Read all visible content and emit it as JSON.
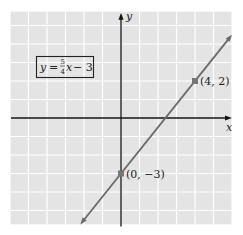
{
  "chart_data": {
    "type": "line",
    "title": "",
    "xlabel": "x",
    "ylabel": "y",
    "xlim": [
      -6,
      6
    ],
    "ylim": [
      -5.75,
      5.75
    ],
    "grid": true,
    "equation": {
      "lhs": "y",
      "equals": "=",
      "numerator": "5",
      "denominator": "4",
      "var": "x",
      "rest": "− 3",
      "slope": 1.25,
      "intercept": -3
    },
    "line_extent_x": [
      -2.2,
      6
    ],
    "points": [
      {
        "x": 4,
        "y": 2,
        "label": "(4, 2)"
      },
      {
        "x": 0,
        "y": -3,
        "label": "(0, −3)"
      }
    ],
    "colors": {
      "background": "#e4e4e4",
      "grid": "#ffffff",
      "axis": "#111111",
      "line": "#6a6a6a",
      "point": "#777777"
    }
  }
}
